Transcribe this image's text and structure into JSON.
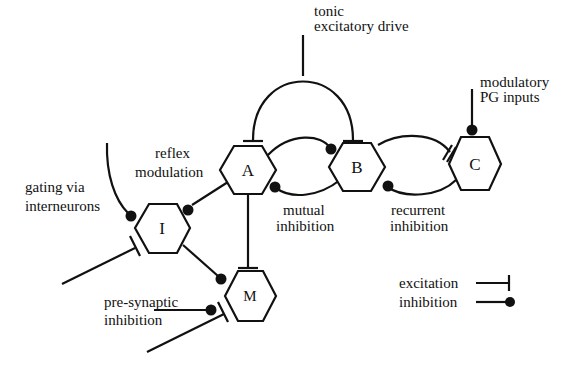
{
  "figure": {
    "colors": {
      "ink": "#111111",
      "background": "#ffffff"
    }
  },
  "nodes": [
    {
      "id": "A",
      "label": "A"
    },
    {
      "id": "B",
      "label": "B"
    },
    {
      "id": "C",
      "label": "C"
    },
    {
      "id": "I",
      "label": "I"
    },
    {
      "id": "M",
      "label": "M"
    }
  ],
  "annotations": {
    "tonic_line1": "tonic",
    "tonic_line2": "excitatory drive",
    "modulatory_line1": "modulatory",
    "modulatory_line2": "PG inputs",
    "reflex_line1": "reflex",
    "reflex_line2": "modulation",
    "gating_line1": "gating via",
    "gating_line2": "interneurons",
    "mutual_line1": "mutual",
    "mutual_line2": "inhibition",
    "recurrent_line1": "recurrent",
    "recurrent_line2": "inhibition",
    "presyn_line1": "pre-synaptic",
    "presyn_line2": "inhibition"
  },
  "legend": {
    "excitation": "excitation",
    "inhibition": "inhibition",
    "excitation_symbol": "bar-terminal",
    "inhibition_symbol": "dot-terminal"
  },
  "edges": [
    {
      "from": "tonic",
      "to": "A",
      "type": "excitation"
    },
    {
      "from": "tonic",
      "to": "B",
      "type": "excitation"
    },
    {
      "from": "A",
      "to": "B",
      "type": "inhibition"
    },
    {
      "from": "B",
      "to": "A",
      "type": "inhibition"
    },
    {
      "from": "B",
      "to": "C",
      "type": "excitation"
    },
    {
      "from": "C",
      "to": "B",
      "type": "inhibition"
    },
    {
      "from": "modulatory",
      "to": "C",
      "type": "inhibition"
    },
    {
      "from": "A",
      "to": "I",
      "type": "inhibition"
    },
    {
      "from": "A",
      "to": "M",
      "type": "excitation"
    },
    {
      "from": "I",
      "to": "M",
      "type": "inhibition"
    },
    {
      "from": "gating",
      "to": "I",
      "type": "inhibition"
    },
    {
      "from": "external",
      "to": "I",
      "type": "excitation"
    },
    {
      "from": "external",
      "to": "M",
      "type": "excitation"
    },
    {
      "from": "presynaptic",
      "to": "M",
      "type": "inhibition"
    }
  ]
}
